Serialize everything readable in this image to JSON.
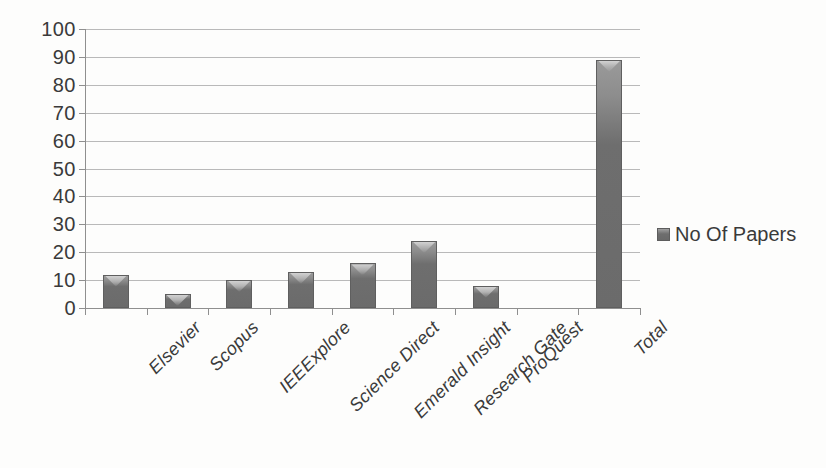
{
  "chart_data": {
    "type": "bar",
    "title": "",
    "subtitle": "",
    "xlabel": "",
    "ylabel": "",
    "categories": [
      "Elsevier",
      "Scopus",
      "IEEExplore",
      "Science Direct",
      "Emerald Insight",
      "Research Gate",
      "ProQuest",
      "",
      "Total"
    ],
    "values": [
      12,
      5,
      10,
      13,
      16,
      24,
      8,
      null,
      89
    ],
    "series": [
      {
        "name": "No Of Papers",
        "values": [
          12,
          5,
          10,
          13,
          16,
          24,
          8,
          null,
          89
        ]
      }
    ],
    "ylim": [
      0,
      100
    ],
    "ytick_step": 10,
    "yticks": [
      100,
      90,
      80,
      70,
      60,
      50,
      40,
      30,
      20,
      10,
      0
    ],
    "grid": "horizontal",
    "legend_position": "right",
    "bar_color": "#6e6e6e",
    "gridline_color": "#b9b9b9",
    "axis_color": "#8f8f8f",
    "background_color": "#fdfdfc",
    "text_color": "#3a3a3a"
  },
  "legend": {
    "entries": [
      {
        "label": "No Of Papers",
        "swatch_color": "#6e6e6e"
      }
    ]
  }
}
